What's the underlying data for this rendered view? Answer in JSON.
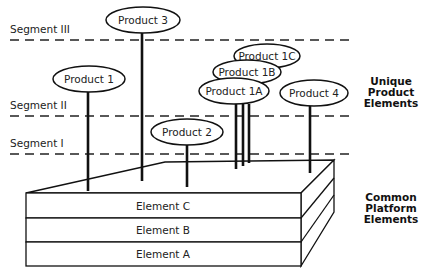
{
  "segments": [
    {
      "label": "Segment III"
    },
    {
      "label": "Segment II"
    },
    {
      "label": "Segment I"
    }
  ],
  "products": {
    "p3": "Product 3",
    "p1": "Product 1",
    "p2": "Product 2",
    "p1c": "Product 1C",
    "p1b": "Product 1B",
    "p1a": "Product 1A",
    "p4": "Product 4"
  },
  "platform": {
    "layers": [
      "Element C",
      "Element B",
      "Element A"
    ]
  },
  "side_labels": {
    "unique": [
      "Unique",
      "Product",
      "Elements"
    ],
    "common": [
      "Common",
      "Platform",
      "Elements"
    ]
  }
}
